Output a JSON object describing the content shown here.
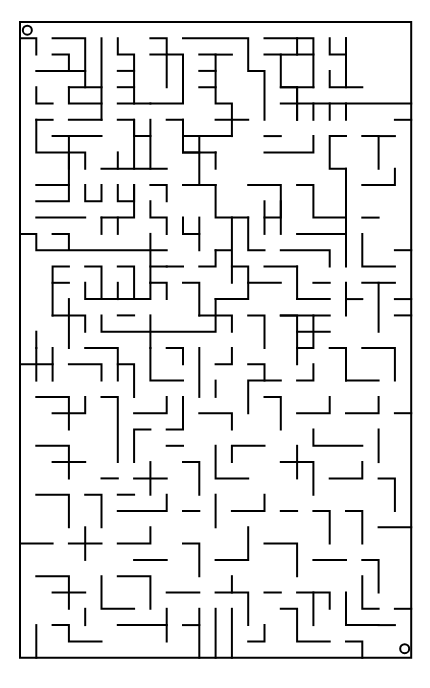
{
  "maze": {
    "origin": [
      20,
      22
    ],
    "cell": 16.3,
    "cols": 24,
    "rows": 39,
    "stroke_color": "#000000",
    "stroke_width": 2,
    "start_marker": {
      "col": 0,
      "row": 0,
      "icon": "circle-start-icon"
    },
    "end_marker": {
      "col": 23,
      "row": 38,
      "icon": "circle-end-icon"
    },
    "entrance_gap": {
      "side": "left",
      "from_row": 1,
      "note": "opening below start"
    },
    "walls": [
      "M0 0 H24 V39 H0 Z",
      "M0 1 H1 V2",
      "M2 1 H4 V4",
      "M2 2 H3 V3",
      "M1 3 H4",
      "M5 1 V6",
      "M3 4 H5",
      "M1 4 V5 H2 M3 4 V5 H5",
      "M6 1 V2 H7 V5",
      "M6 3 H7",
      "M6 4 H7",
      "M6 5 H8",
      "M8 1 H9 V2 H10 V5 H8",
      "M8 2 H9 V4",
      "M9 3",
      "M10 1 H14 V3 H15 V6",
      "M11 2 H12 V4",
      "M13 2 H12",
      "M11 3 H12",
      "M11 4 H12 V5 H13 V6",
      "M15 1 H17 V2 H18",
      "M17 1 H18 V4",
      "M16 2 H17",
      "M15 2 H16 V4 H17 V6",
      "M18 4 H16",
      "M17 5 V4",
      "M19 1 V2 H20 V1",
      "M20 1 V4 H21",
      "M19 3 V4 H20",
      "M16 5 H24",
      "M17 6 V5",
      "M18 6 V5",
      "M19 6 V5",
      "M20 6 V5",
      "M23 6 H24",
      "M1 6 H2",
      "M3 6 H5",
      "M1 6 V8 H4 V9 M2 7 H4",
      "M5 7 H3 V9",
      "M6 6 H7 V7 H8",
      "M7 6 V9",
      "M8 6 V9",
      "M6 8 V9",
      "M5 9 H9",
      "M9 6 H10 V8 H11",
      "M10 6 V7 H11 V10",
      "M11 7 H13",
      "M13 6 V7",
      "M12 8 H10",
      "M12 8 V9",
      "M14 6 H12",
      "M15 7 H16",
      "M15 8 H18 V7",
      "M20 7 H19 V9 H20",
      "M21 7 H22 V9",
      "M22 7 H23",
      "M1 10 H3",
      "M1 11 H3 V8",
      "M1 12 H4",
      "M0 13 H1 V14 H9 M2 13 H3 V14",
      "M4 10 V11 H5 V10",
      "M6 10 V11 H7 V10",
      "M5 12 H7 V10",
      "M5 12 V13",
      "M6 12 V13",
      "M8 10 H9 V11 M8 11 V12 H9 V13",
      "M10 10 H12",
      "M12 10 V12 H14",
      "M10 12 V13",
      "M11 12 V13",
      "M10 13 H11 V14",
      "M8 13 V16",
      "M13 12 V14 H12 M13 14 V16",
      "M14 10 H16 V12 H15 M14 12 V14 H15",
      "M15 11 V13",
      "M16 11 V13",
      "M17 10 H18 V12 H20 V9",
      "M20 12 V15",
      "M20 13 H17",
      "M16 14 H19 V15",
      "M21 10 H23 V9",
      "M21 12 H22",
      "M21 13 V15 H23",
      "M23 14 H24",
      "M22 16 H23",
      "M3 15 H2 V18",
      "M2 16 H3",
      "M4 15 H5 V17",
      "M6 15 H7 V17",
      "M4 16 V17 H8 V16",
      "M6 16 V17",
      "M8 15 H9",
      "M8 16 H9 V17",
      "M10 15 H9",
      "M10 16 H11 V18",
      "M11 15 H12 V14",
      "M13 15 H14 V17 H12",
      "M14 16 H16",
      "M15 15 H17",
      "M17 15 V17 H18",
      "M18 16 H19",
      "M19 17 H17",
      "M20 16 V18",
      "M21 16 H22 V19",
      "M21 17 H20",
      "M23 17 H24",
      "M23 18 H24",
      "M2 18 H4 V19",
      "M3 17 V20",
      "M1 19 V20",
      "M5 18 V19 H12 V17",
      "M6 18 H7",
      "M8 20 V18",
      "M11 18 H13 V19",
      "M14 18 H15 V20",
      "M16 18 H17 V21",
      "M18 18 H16",
      "M19 19 H17",
      "M19 18 H18 V20 H17",
      "M0 21 H2",
      "M1 20 V22",
      "M2 22 V20",
      "M3 21 H5 V22",
      "M4 20 H6 V22",
      "M6 21 H7 V23",
      "M8 20 V22 H10",
      "M9 20 H10 V21",
      "M11 20 V23",
      "M12 21 H13 V20",
      "M14 21 H15 V22",
      "M16 22 H14 V24",
      "M17 22 H18 V21",
      "M19 20 H20 V22",
      "M21 20 H23 V22",
      "M20 22 H22",
      "M1 23 H3 V25",
      "M2 24 H4 V23",
      "M5 23 H6 V27",
      "M7 24 H9 V23",
      "M8 25 H7 V27",
      "M9 25 H10 V23",
      "M10 26 H9",
      "M11 24 H13 V25",
      "M12 23 V22",
      "M15 23 H16 V25",
      "M17 24 H19 V23",
      "M18 25 V26 H21",
      "M20 24 H22 V23",
      "M23 24 H24",
      "M22 25 V27",
      "M1 26 H3 V28",
      "M2 27 H4",
      "M6 28 H5",
      "M7 28 H9",
      "M8 27 V29",
      "M10 27 H11 V29",
      "M12 26 V28 H14",
      "M13 27 V26 H15",
      "M16 27 H18 V29",
      "M17 26 V28",
      "M19 28 H21 V27",
      "M22 28 H23 V30",
      "M1 29 H3 V31",
      "M4 29 H5 V31",
      "M6 29 H7",
      "M6 30 H9 V29",
      "M10 30 H11",
      "M12 29 V31",
      "M13 30 H15 V29",
      "M16 30 H17",
      "M18 30 H19 V32",
      "M20 30 H21 V32",
      "M22 31 H24",
      "M0 32 H2",
      "M3 32 H5",
      "M4 33 V31",
      "M6 32 H8 V31",
      "M7 33 H9",
      "M10 32 H11 V34",
      "M12 33 H14 V31",
      "M15 32 H17 V34",
      "M18 33 H20",
      "M21 33 H22 V35",
      "M1 34 H3 V36",
      "M2 35 H4",
      "M5 34 V36 H7",
      "M6 34 H8 V36",
      "M9 35 H11",
      "M12 35 H14 V37",
      "M13 35 V34",
      "M15 35 H16",
      "M17 35 H19 V36",
      "M20 35 V37 H22",
      "M23 36 H24",
      "M1 37 V39",
      "M2 37 H3 V38 H5",
      "M4 37 V36",
      "M6 37 H9 V38",
      "M9 36 V37",
      "M10 37 H11",
      "M11 36 V39",
      "M12 36 V39",
      "M13 36 V39",
      "M14 38 H15 V37",
      "M16 36 H17 V38 H19",
      "M18 35 V37",
      "M20 38 H21 V39",
      "M21 34 V36 H22",
      "M22 37 H23"
    ]
  }
}
